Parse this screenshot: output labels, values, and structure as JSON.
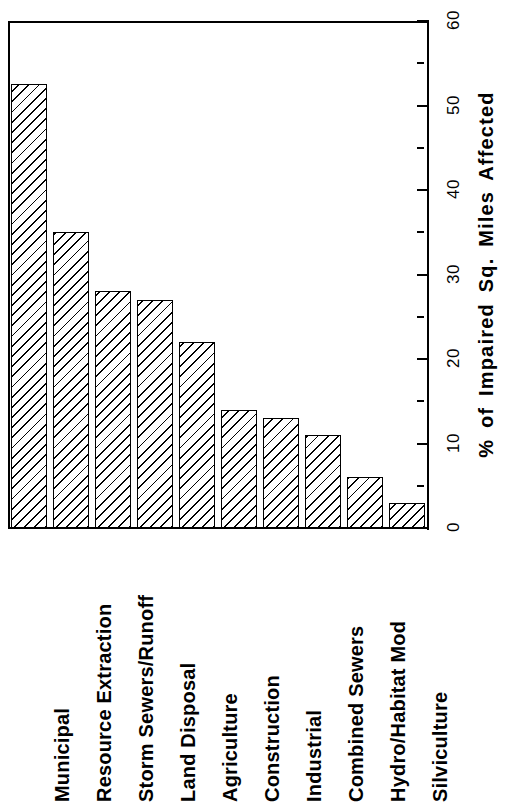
{
  "chart_data": {
    "type": "bar",
    "title": "",
    "subtitle": "",
    "xlabel": "",
    "ylabel": "% of Impaired Sq. Miles Affected",
    "orientation": "vertical",
    "grid": false,
    "legend": null,
    "ylim": [
      0,
      60
    ],
    "ytick_labels": [
      "0",
      "10",
      "20",
      "30",
      "40",
      "50",
      "60"
    ],
    "ytick_values": [
      0,
      10,
      20,
      30,
      40,
      50,
      60
    ],
    "yminor_tick_values": [
      5,
      15,
      25,
      35,
      45,
      55
    ],
    "categories": [
      "Municipal",
      "Resource Extraction",
      "Storm Sewers/Runoff",
      "Land Disposal",
      "Agriculture",
      "Construction",
      "Industrial",
      "Combined Sewers",
      "Hydro/Habitat Mod",
      "Silviculture"
    ],
    "values": [
      52.5,
      35.0,
      28.0,
      27.0,
      22.0,
      14.0,
      13.0,
      11.0,
      6.0,
      3.0
    ],
    "bar_style": {
      "fill": "diagonal-hatch",
      "edge_color": "#000000",
      "face_color": "#ffffff"
    }
  },
  "colors": {
    "foreground": "#000000",
    "background": "#ffffff"
  }
}
